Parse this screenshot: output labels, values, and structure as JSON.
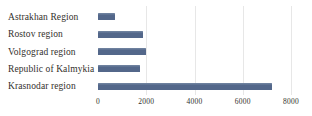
{
  "chart_data": {
    "type": "bar",
    "orientation": "horizontal",
    "title": "",
    "xlabel": "",
    "ylabel": "",
    "categories": [
      "Astrakhan Region",
      "Rostov region",
      "Volgograd region",
      "Republic of Kalmykia",
      "Krasnodar region"
    ],
    "values": [
      700,
      1870,
      2000,
      1730,
      7230
    ],
    "xlim": [
      0,
      8000
    ],
    "x_ticks": [
      0,
      2000,
      4000,
      6000,
      8000
    ],
    "x_tick_labels": [
      "0",
      "2000",
      "4000",
      "6000",
      "8000"
    ],
    "grid": true,
    "legend": false,
    "colors": {
      "bar": "#53678a",
      "bar_top_edge": "#7487a3",
      "gridline": "#e7e7e7",
      "text": "#33302c"
    }
  }
}
